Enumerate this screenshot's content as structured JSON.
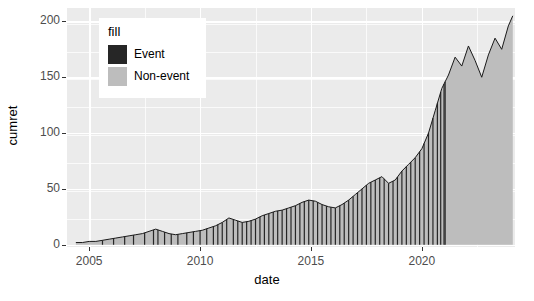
{
  "chart_data": {
    "type": "area",
    "title": "",
    "xlabel": "date",
    "ylabel": "cumret",
    "xlim": [
      2004.0,
      2024.2
    ],
    "ylim": [
      -2,
      212
    ],
    "grid": true,
    "x_ticks": [
      2005,
      2010,
      2015,
      2020
    ],
    "x_tick_labels": [
      "2005",
      "2010",
      "2015",
      "2020"
    ],
    "y_ticks": [
      0,
      50,
      100,
      150,
      200
    ],
    "y_tick_labels": [
      "0",
      "50",
      "100",
      "150",
      "200"
    ],
    "legend": {
      "title": "fill",
      "position": "inside-top-left",
      "entries": [
        {
          "label": "Event",
          "color": "#262626"
        },
        {
          "label": "Non-event",
          "color": "#bdbdbd"
        }
      ]
    },
    "series": [
      {
        "name": "cumret",
        "line_color": "#1a1a1a",
        "fill_color": "#bdbdbd",
        "x": [
          2004.4,
          2004.7,
          2005.0,
          2005.3,
          2005.6,
          2005.9,
          2006.2,
          2006.5,
          2006.8,
          2007.1,
          2007.4,
          2007.7,
          2008.0,
          2008.3,
          2008.6,
          2008.9,
          2009.2,
          2009.5,
          2009.8,
          2010.1,
          2010.4,
          2010.7,
          2011.0,
          2011.3,
          2011.6,
          2011.9,
          2012.2,
          2012.5,
          2012.8,
          2013.1,
          2013.4,
          2013.7,
          2014.0,
          2014.3,
          2014.6,
          2014.9,
          2015.2,
          2015.5,
          2015.8,
          2016.1,
          2016.4,
          2016.7,
          2017.0,
          2017.3,
          2017.6,
          2017.9,
          2018.2,
          2018.5,
          2018.8,
          2019.1,
          2019.4,
          2019.7,
          2020.0,
          2020.3,
          2020.6,
          2020.9,
          2021.2,
          2021.5,
          2021.8,
          2022.1,
          2022.4,
          2022.7,
          2023.0,
          2023.3,
          2023.6,
          2023.9,
          2024.1
        ],
        "y": [
          2,
          2,
          3,
          3,
          4,
          5,
          6,
          7,
          8,
          9,
          10,
          12,
          14,
          12,
          10,
          9,
          10,
          11,
          12,
          13,
          15,
          17,
          20,
          24,
          22,
          20,
          21,
          23,
          26,
          28,
          30,
          31,
          33,
          35,
          38,
          40,
          39,
          36,
          34,
          33,
          36,
          40,
          45,
          50,
          55,
          58,
          61,
          55,
          58,
          66,
          72,
          78,
          86,
          100,
          120,
          140,
          152,
          168,
          160,
          178,
          165,
          150,
          170,
          185,
          175,
          196,
          205
        ]
      }
    ],
    "event_markers": {
      "description": "thin dark vertical bars marking event dates, drawn from baseline to the cumulative return curve",
      "color": "#262626",
      "x": [
        2005.6,
        2006.1,
        2006.6,
        2007.0,
        2007.5,
        2007.9,
        2008.1,
        2008.4,
        2008.7,
        2009.0,
        2009.4,
        2009.7,
        2010.0,
        2010.3,
        2010.6,
        2010.8,
        2011.0,
        2011.2,
        2011.5,
        2011.7,
        2011.9,
        2012.1,
        2012.3,
        2012.5,
        2012.7,
        2012.9,
        2013.1,
        2013.3,
        2013.5,
        2013.7,
        2013.9,
        2014.1,
        2014.3,
        2014.5,
        2014.7,
        2014.9,
        2015.1,
        2015.3,
        2015.5,
        2015.7,
        2015.9,
        2016.1,
        2016.3,
        2016.5,
        2016.7,
        2016.9,
        2017.1,
        2017.3,
        2017.5,
        2017.7,
        2017.9,
        2018.1,
        2018.3,
        2018.5,
        2018.7,
        2018.9,
        2019.1,
        2019.3,
        2019.5,
        2019.7,
        2019.9,
        2020.1,
        2020.3,
        2020.5,
        2020.7,
        2020.85,
        2021.0,
        2021.05
      ]
    }
  }
}
